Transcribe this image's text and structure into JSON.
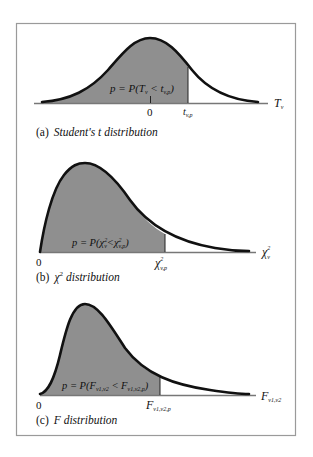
{
  "figure": {
    "panels": [
      {
        "id": "a",
        "caption_prefix": "(a)",
        "caption": "Student's t distribution",
        "area_label_p": "p = P(T",
        "area_label_sub1": "v",
        "area_label_mid": " < t",
        "area_label_sub2": "v,p",
        "area_label_end": ")",
        "tick_zero": "0",
        "cutoff_label": "t",
        "cutoff_sub": "v,p",
        "axis_label": "T",
        "axis_sub": "v"
      },
      {
        "id": "b",
        "caption_prefix": "(b)",
        "caption_symbol": "χ",
        "caption_sup": "2",
        "caption": "distribution",
        "area_label_p": "p = P(χ",
        "area_label_sup1": "2",
        "area_label_sub1": "v",
        "area_label_mid": "<χ",
        "area_label_sup2": "2",
        "area_label_sub2": "v,p",
        "area_label_end": ")",
        "tick_zero": "0",
        "cutoff_label": "χ",
        "cutoff_sup": "2",
        "cutoff_sub": "v,p",
        "axis_label": "χ",
        "axis_sup": "2",
        "axis_sub": "v"
      },
      {
        "id": "c",
        "caption_prefix": "(c)",
        "caption": "F distribution",
        "area_label_p": "p = P(F",
        "area_label_sub1": "v1,v2",
        "area_label_mid": " < F",
        "area_label_sub2": "v1,v2,p",
        "area_label_end": ")",
        "tick_zero": "0",
        "cutoff_label": "F",
        "cutoff_sub": "v1,v2,p",
        "axis_label": "F",
        "axis_sub": "v1,v2"
      }
    ],
    "colors": {
      "shaded_area": "#8f8f8f",
      "curve": "#111111",
      "frame": "#9a9a9a"
    }
  }
}
